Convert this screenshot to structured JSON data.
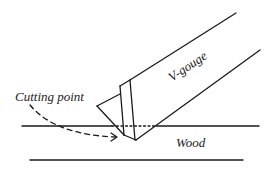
{
  "diagram": {
    "labels": {
      "tool": "V-gouge",
      "cutting_point": "Cutting point",
      "material": "Wood"
    },
    "colors": {
      "ink": "#1a1a1a",
      "background": "#ffffff"
    }
  }
}
